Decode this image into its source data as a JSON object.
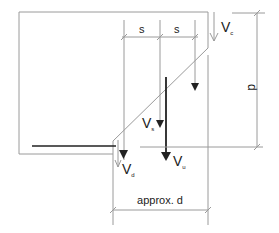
{
  "diagram": {
    "labels": {
      "spacing_1": "s",
      "spacing_2": "s",
      "depth": "d",
      "depth_approx": "approx. d",
      "vc": {
        "main": "V",
        "sub": "c"
      },
      "vs": {
        "main": "V",
        "sub": "s"
      },
      "vd": {
        "main": "V",
        "sub": "d"
      },
      "vu": {
        "main": "V",
        "sub": "u"
      }
    },
    "colors": {
      "line": "#9a9a9a",
      "thick": "#222222",
      "text": "#222222"
    }
  }
}
